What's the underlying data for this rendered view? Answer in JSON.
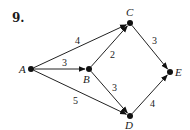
{
  "problem": {
    "number": "9."
  },
  "graph": {
    "directed": true,
    "nodes": [
      {
        "id": "A",
        "label": "A",
        "x": 31,
        "y": 69,
        "label_x": 19,
        "label_y": 73
      },
      {
        "id": "B",
        "label": "B",
        "x": 89,
        "y": 69,
        "label_x": 83,
        "label_y": 83
      },
      {
        "id": "C",
        "label": "C",
        "x": 130,
        "y": 23,
        "label_x": 126,
        "label_y": 16
      },
      {
        "id": "D",
        "label": "D",
        "x": 130,
        "y": 116,
        "label_x": 125,
        "label_y": 129
      },
      {
        "id": "E",
        "label": "E",
        "x": 170,
        "y": 72,
        "label_x": 175,
        "label_y": 76
      }
    ],
    "edges": [
      {
        "from": "A",
        "to": "C",
        "weight": "4",
        "weight_x": 75,
        "weight_y": 44
      },
      {
        "from": "A",
        "to": "B",
        "weight": "3",
        "weight_x": 62,
        "weight_y": 66
      },
      {
        "from": "A",
        "to": "D",
        "weight": "5",
        "weight_x": 73,
        "weight_y": 104
      },
      {
        "from": "B",
        "to": "C",
        "weight": "2",
        "weight_x": 110,
        "weight_y": 58
      },
      {
        "from": "B",
        "to": "D",
        "weight": "3",
        "weight_x": 112,
        "weight_y": 91
      },
      {
        "from": "C",
        "to": "E",
        "weight": "3",
        "weight_x": 152,
        "weight_y": 44
      },
      {
        "from": "D",
        "to": "E",
        "weight": "4",
        "weight_x": 150,
        "weight_y": 107
      }
    ]
  }
}
